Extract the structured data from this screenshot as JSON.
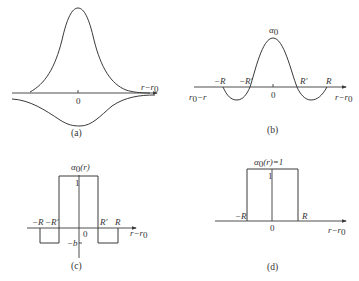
{
  "figure": {
    "panels": [
      {
        "id": "a",
        "caption": "(a)",
        "origin_label": "0",
        "x_axis_label": "r−r",
        "x_axis_sub": "0"
      },
      {
        "id": "b",
        "caption": "(b)",
        "origin_label": "0",
        "peak_label": "α",
        "peak_sub": "0",
        "left_axis_label": "r",
        "left_axis_sub": "0",
        "left_axis_tail": "−r",
        "x_axis_label": "r−r",
        "x_axis_sub": "0",
        "ticks": [
          "−R",
          "−R′",
          "R′",
          "R"
        ]
      },
      {
        "id": "c",
        "caption": "(c)",
        "origin_label": "0",
        "y_axis_label": "α",
        "y_axis_sub": "0",
        "y_axis_arg": "(r)",
        "one_label": "1",
        "neg_label": "−b",
        "x_axis_label": "r−r",
        "x_axis_sub": "0",
        "ticks": [
          "−R",
          "−R′",
          "R′",
          "R"
        ]
      },
      {
        "id": "d",
        "caption": "(d)",
        "origin_label": "0",
        "y_axis_label": "α",
        "y_axis_sub": "0",
        "y_axis_arg": "(r)=1",
        "one_label": "1",
        "x_axis_label": "r−r",
        "x_axis_sub": "0",
        "ticks": [
          "−R",
          "R"
        ]
      }
    ]
  }
}
